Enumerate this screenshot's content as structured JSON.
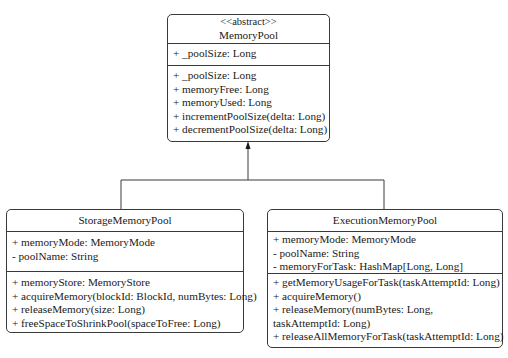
{
  "diagram": {
    "type": "UML class diagram",
    "relationship": "inheritance",
    "classes": {
      "memory_pool": {
        "stereotype": "<<abstract>>",
        "name": "MemoryPool",
        "attributes": [
          "+ _poolSize: Long"
        ],
        "methods": [
          "+ _poolSize: Long",
          "+ memoryFree: Long",
          "+ memoryUsed: Long",
          "+ incrementPoolSize(delta: Long)",
          "+ decrementPoolSize(delta: Long)"
        ]
      },
      "storage_memory_pool": {
        "name": "StorageMemoryPool",
        "attributes": [
          "+ memoryMode: MemoryMode",
          "- poolName: String"
        ],
        "methods": [
          "+ memoryStore: MemoryStore",
          "+ acquireMemory(blockId: BlockId, numBytes: Long)",
          "+ releaseMemory(size: Long)",
          "+ freeSpaceToShrinkPool(spaceToFree: Long)"
        ]
      },
      "execution_memory_pool": {
        "name": "ExecutionMemoryPool",
        "attributes": [
          "+ memoryMode: MemoryMode",
          "- poolName: String",
          "- memoryForTask: HashMap[Long, Long]"
        ],
        "methods": [
          "+ getMemoryUsageForTask(taskAttemptId: Long)",
          "+ acquireMemory()",
          "+ releaseMemory(numBytes: Long, taskAttemptId: Long)",
          "+ releaseAllMemoryForTask(taskAttemptId: Long)"
        ]
      }
    },
    "edges": [
      {
        "from": "StorageMemoryPool",
        "to": "MemoryPool",
        "kind": "generalization"
      },
      {
        "from": "ExecutionMemoryPool",
        "to": "MemoryPool",
        "kind": "generalization"
      }
    ],
    "colors": {
      "line": "#3a3a3a",
      "background": "#ffffff",
      "text": "#1a1a1a"
    }
  }
}
